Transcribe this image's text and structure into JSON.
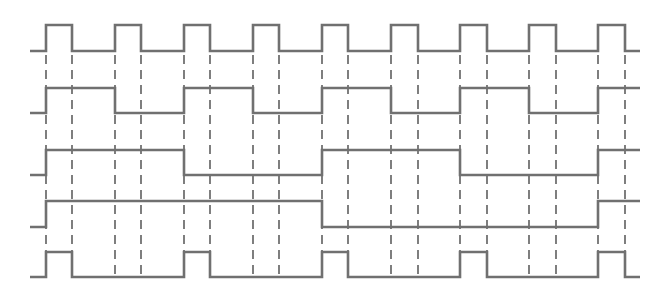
{
  "diagram": {
    "type": "timing-diagram",
    "x_start": 30,
    "x_end": 640,
    "rise_times": [
      46,
      115,
      184,
      253,
      322,
      391,
      460,
      529,
      598
    ],
    "pulse_width": 27,
    "guide_lines": {
      "x": [
        46,
        72,
        115,
        141,
        184,
        210,
        253,
        279,
        322,
        348,
        391,
        418,
        460,
        487,
        529,
        556,
        598,
        625
      ],
      "y_top": 55,
      "y_bottom": 277
    },
    "signals": [
      {
        "name": "clock",
        "y_high": 25,
        "y_low": 51,
        "transitions": [
          [
            30,
            0
          ],
          [
            46,
            1
          ],
          [
            72,
            0
          ],
          [
            115,
            1
          ],
          [
            141,
            0
          ],
          [
            184,
            1
          ],
          [
            210,
            0
          ],
          [
            253,
            1
          ],
          [
            279,
            0
          ],
          [
            322,
            1
          ],
          [
            348,
            0
          ],
          [
            391,
            1
          ],
          [
            418,
            0
          ],
          [
            460,
            1
          ],
          [
            487,
            0
          ],
          [
            529,
            1
          ],
          [
            556,
            0
          ],
          [
            598,
            1
          ],
          [
            625,
            0
          ],
          [
            640,
            0
          ]
        ]
      },
      {
        "name": "q0",
        "y_high": 88,
        "y_low": 113,
        "transitions": [
          [
            30,
            0
          ],
          [
            46,
            1
          ],
          [
            115,
            0
          ],
          [
            184,
            1
          ],
          [
            253,
            0
          ],
          [
            322,
            1
          ],
          [
            391,
            0
          ],
          [
            460,
            1
          ],
          [
            529,
            0
          ],
          [
            598,
            1
          ],
          [
            640,
            1
          ]
        ]
      },
      {
        "name": "q1",
        "y_high": 150,
        "y_low": 175,
        "transitions": [
          [
            30,
            0
          ],
          [
            46,
            1
          ],
          [
            184,
            0
          ],
          [
            322,
            1
          ],
          [
            460,
            0
          ],
          [
            598,
            1
          ],
          [
            640,
            1
          ]
        ]
      },
      {
        "name": "q2",
        "y_high": 201,
        "y_low": 227,
        "transitions": [
          [
            30,
            0
          ],
          [
            46,
            1
          ],
          [
            322,
            0
          ],
          [
            598,
            1
          ],
          [
            640,
            1
          ]
        ]
      },
      {
        "name": "output-pulse",
        "y_high": 252,
        "y_low": 277,
        "transitions": [
          [
            30,
            0
          ],
          [
            46,
            1
          ],
          [
            72,
            0
          ],
          [
            184,
            1
          ],
          [
            210,
            0
          ],
          [
            322,
            1
          ],
          [
            348,
            0
          ],
          [
            460,
            1
          ],
          [
            487,
            0
          ],
          [
            598,
            1
          ],
          [
            625,
            0
          ],
          [
            640,
            0
          ]
        ]
      }
    ],
    "colors": {
      "signal": "#707070",
      "guide": "#2a2a2a",
      "background": "#ffffff"
    }
  }
}
